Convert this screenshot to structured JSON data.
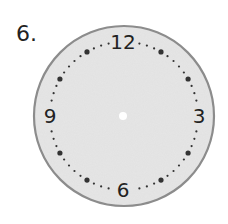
{
  "question": {
    "number_label": "6."
  },
  "clock": {
    "center": [
      124,
      116
    ],
    "outer_radius": 91,
    "dot_ring_radius": 74,
    "numeral_radius": 75,
    "face_color": "#e6e6e6",
    "border_color": "#8c8c8c",
    "dot_color": "#333333",
    "center_dot_color": "#ffffff",
    "numerals": [
      {
        "label": "12",
        "position": 12
      },
      {
        "label": "3",
        "position": 3
      },
      {
        "label": "6",
        "position": 6
      },
      {
        "label": "9",
        "position": 9
      }
    ],
    "hands": "none"
  }
}
